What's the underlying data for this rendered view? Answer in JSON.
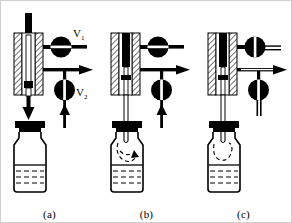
{
  "figure": {
    "background_color": "#ffffff",
    "line_color": "#000000",
    "border_color": "#cfcfcf"
  },
  "panels": [
    {
      "id": "a",
      "label": "(a)",
      "caption_label": "(a)",
      "state": "standby",
      "valves": [
        {
          "name": "V1",
          "label": "V",
          "subscript": "1",
          "position": "open",
          "slit": "horizontal",
          "show_label": true
        },
        {
          "name": "V2",
          "label": "V",
          "subscript": "2",
          "position": "open",
          "slit": "vertical",
          "show_label": true
        }
      ],
      "needle": {
        "inserted": false,
        "depth": "retracted"
      },
      "vial": {
        "cap": "crimp-cap",
        "liquid": true,
        "headspace_flow": "none"
      },
      "arrows": [
        {
          "name": "needle-down-arrow",
          "direction": "down"
        },
        {
          "name": "carrier-gas-up-arrow",
          "direction": "up"
        },
        {
          "name": "vent-outlet-arrow",
          "direction": "right"
        }
      ]
    },
    {
      "id": "b",
      "label": "(b)",
      "caption_label": "(b)",
      "state": "pressurize",
      "valves": [
        {
          "name": "V1",
          "label": "V",
          "subscript": "1",
          "position": "open",
          "slit": "horizontal",
          "show_label": false
        },
        {
          "name": "V2",
          "label": "V",
          "subscript": "2",
          "position": "open",
          "slit": "vertical",
          "show_label": false
        }
      ],
      "needle": {
        "inserted": true,
        "depth": "headspace"
      },
      "vial": {
        "cap": "crimp-cap",
        "liquid": true,
        "headspace_flow": "swirl"
      },
      "arrows": [
        {
          "name": "carrier-gas-up-arrow",
          "direction": "up"
        },
        {
          "name": "vent-outlet-arrow",
          "direction": "right"
        },
        {
          "name": "headspace-swirl-arrow",
          "direction": "curved"
        }
      ]
    },
    {
      "id": "c",
      "label": "(c)",
      "caption_label": "(c)",
      "state": "transfer",
      "valves": [
        {
          "name": "V1",
          "label": "V",
          "subscript": "1",
          "position": "closed",
          "slit": "vertical",
          "show_label": false
        },
        {
          "name": "V2",
          "label": "V",
          "subscript": "2",
          "position": "closed",
          "slit": "vertical",
          "show_label": false
        }
      ],
      "needle": {
        "inserted": true,
        "depth": "headspace"
      },
      "vial": {
        "cap": "crimp-cap",
        "liquid": true,
        "headspace_flow": "loop"
      },
      "arrows": [
        {
          "name": "vent-outlet-arrow",
          "direction": "right"
        }
      ]
    }
  ]
}
